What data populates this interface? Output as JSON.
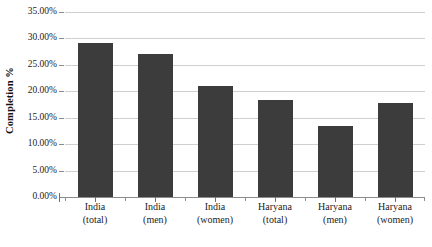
{
  "chart_data": {
    "type": "bar",
    "title": "",
    "xlabel": "",
    "ylabel": "Completion %",
    "categories": [
      "India (total)",
      "India (men)",
      "India (women)",
      "Haryana (total)",
      "Haryana (men)",
      "Haryana (women)"
    ],
    "category_lines": [
      {
        "line1": "India",
        "line2": "(total)"
      },
      {
        "line1": "India",
        "line2": "(men)"
      },
      {
        "line1": "India",
        "line2": "(women)"
      },
      {
        "line1": "Haryana",
        "line2": "(total)"
      },
      {
        "line1": "Haryana",
        "line2": "(men)"
      },
      {
        "line1": "Haryana",
        "line2": "(women)"
      }
    ],
    "values": [
      29.2,
      27.0,
      21.0,
      18.3,
      13.4,
      17.8
    ],
    "ylim": [
      0,
      35
    ],
    "ytick_values": [
      0,
      5,
      10,
      15,
      20,
      25,
      30,
      35
    ],
    "ytick_labels": [
      "0.00%",
      "5.00%",
      "10.00%",
      "15.00%",
      "20.00%",
      "25.00%",
      "30.00%",
      "35.00%"
    ],
    "grid": true,
    "legend": false,
    "legend_position": "none",
    "bar_color": "#3c3c3c",
    "gridline_color": "#cfcfcf",
    "axis_color": "#8c8c8c",
    "background_color": "#ffffff"
  }
}
